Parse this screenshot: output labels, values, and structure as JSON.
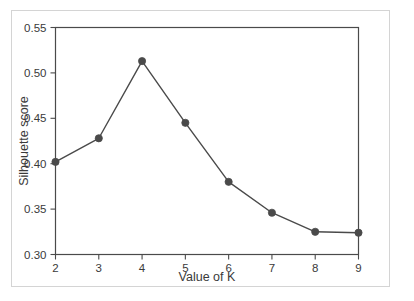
{
  "chart_data": {
    "type": "line",
    "title": "",
    "xlabel": "Value of K",
    "ylabel": "Silhouette score",
    "x": [
      2,
      3,
      4,
      5,
      6,
      7,
      8,
      9
    ],
    "values": [
      0.402,
      0.428,
      0.513,
      0.445,
      0.38,
      0.346,
      0.325,
      0.324
    ],
    "series": [
      {
        "name": "Silhouette score",
        "values": [
          0.402,
          0.428,
          0.513,
          0.445,
          0.38,
          0.346,
          0.325,
          0.324
        ]
      }
    ],
    "xlim": [
      2,
      9
    ],
    "ylim": [
      0.3,
      0.55
    ],
    "xticks": [
      2,
      3,
      4,
      5,
      6,
      7,
      8,
      9
    ],
    "xtick_labels": [
      "2",
      "3",
      "4",
      "5",
      "6",
      "7",
      "8",
      "9"
    ],
    "yticks": [
      0.3,
      0.35,
      0.4,
      0.45,
      0.5,
      0.55
    ],
    "ytick_labels": [
      "0.30",
      "0.35",
      "0.40",
      "0.45",
      "0.50",
      "0.55"
    ],
    "grid": false,
    "legend": false,
    "marker": "circle",
    "line_color": "#4a4a4a",
    "marker_color": "#4a4a4a",
    "axis_color": "#4a4a4a",
    "background_color": "#ffffff",
    "frame_color": "#d4d4d4",
    "peak": {
      "x": 4,
      "y": 0.513
    },
    "annotations": []
  }
}
